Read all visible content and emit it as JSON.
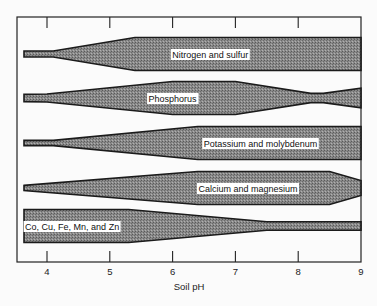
{
  "chart_data": {
    "type": "band-diagram",
    "title": "",
    "xlabel": "Soil pH",
    "xlim": [
      3.55,
      9.0
    ],
    "x_ticks": [
      4,
      5,
      6,
      7,
      8,
      9
    ],
    "x_tick_labels": [
      "4",
      "5",
      "6",
      "7",
      "8",
      "9"
    ],
    "note": "Band width represents relative nutrient availability (0 to 1) at each soil pH",
    "series": [
      {
        "name": "Nitrogen and sulfur",
        "label": "Nitrogen and sulfur",
        "label_ph": 6.6,
        "points": [
          [
            3.65,
            0.18
          ],
          [
            4.1,
            0.18
          ],
          [
            5.4,
            1.0
          ],
          [
            9.0,
            1.0
          ]
        ]
      },
      {
        "name": "Phosphorus",
        "label": "Phosphorus",
        "label_ph": 6.0,
        "points": [
          [
            3.65,
            0.22
          ],
          [
            4.0,
            0.24
          ],
          [
            6.0,
            1.0
          ],
          [
            7.0,
            1.0
          ],
          [
            8.2,
            0.28
          ],
          [
            8.4,
            0.28
          ],
          [
            9.0,
            0.6
          ]
        ]
      },
      {
        "name": "Potassium and molybdenum",
        "label": "Potassium and molybdenum",
        "label_ph": 7.4,
        "points": [
          [
            3.65,
            0.16
          ],
          [
            4.1,
            0.16
          ],
          [
            6.4,
            1.0
          ],
          [
            9.0,
            1.0
          ]
        ]
      },
      {
        "name": "Calcium and magnesium",
        "label": "Calcium and magnesium",
        "label_ph": 7.2,
        "points": [
          [
            3.65,
            0.16
          ],
          [
            6.4,
            1.0
          ],
          [
            8.5,
            1.0
          ],
          [
            9.0,
            0.45
          ]
        ]
      },
      {
        "name": "Co, Cu, Fe, Mn, and Zn",
        "label": "Co, Cu, Fe, Mn, and Zn",
        "label_ph": 4.4,
        "points": [
          [
            3.65,
            1.0
          ],
          [
            5.3,
            1.0
          ],
          [
            7.5,
            0.26
          ],
          [
            9.0,
            0.26
          ]
        ]
      }
    ]
  }
}
